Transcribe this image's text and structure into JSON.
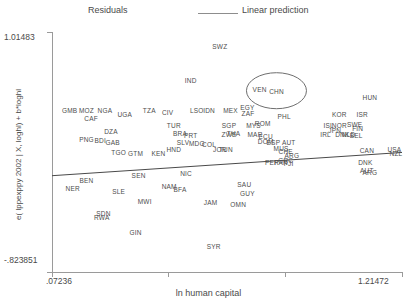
{
  "legend": {
    "residuals_label": "Residuals",
    "linear_prediction_label": "Linear prediction"
  },
  "axes": {
    "x_title": "ln human capital",
    "y_title": "e( lppexppy 2002 | X, loghl) + b*loghl",
    "x_min_label": ".07236",
    "x_max_label": "1.21472",
    "y_min_label": "-.823851",
    "y_max_label": "1.01483"
  },
  "chart_data": {
    "type": "scatter",
    "title": "",
    "xlabel": "ln human capital",
    "ylabel": "e( lppexppy 2002 | X, loghl) + b*loghl",
    "xlim": [
      0.07236,
      1.21472
    ],
    "ylim": [
      -0.823851,
      1.01483
    ],
    "grid": false,
    "legend_position": "top",
    "marker_style": "country-code-text-label",
    "annotations": [
      {
        "type": "ellipse",
        "label": "CHN",
        "x": 0.805,
        "y": 0.565,
        "rx_px": 30,
        "ry_px": 18
      }
    ],
    "series": [
      {
        "name": "Linear prediction",
        "type": "line",
        "x": [
          0.07236,
          1.21472
        ],
        "y": [
          -0.086,
          0.092
        ]
      },
      {
        "name": "Residuals",
        "type": "scatter",
        "points": [
          {
            "label": "SWZ",
            "x": 0.62,
            "y": 0.905
          },
          {
            "label": "IND",
            "x": 0.525,
            "y": 0.65
          },
          {
            "label": "VEN",
            "x": 0.75,
            "y": 0.58
          },
          {
            "label": "CHN",
            "x": 0.805,
            "y": 0.565
          },
          {
            "label": "HUN",
            "x": 1.11,
            "y": 0.52
          },
          {
            "label": "GMB",
            "x": 0.13,
            "y": 0.42
          },
          {
            "label": "MOZ",
            "x": 0.185,
            "y": 0.42
          },
          {
            "label": "NGA",
            "x": 0.245,
            "y": 0.42
          },
          {
            "label": "CAF",
            "x": 0.2,
            "y": 0.355
          },
          {
            "label": "UGA",
            "x": 0.31,
            "y": 0.39
          },
          {
            "label": "TZA",
            "x": 0.39,
            "y": 0.42
          },
          {
            "label": "CIV",
            "x": 0.45,
            "y": 0.405
          },
          {
            "label": "LSO",
            "x": 0.545,
            "y": 0.415
          },
          {
            "label": "IDN",
            "x": 0.585,
            "y": 0.415
          },
          {
            "label": "MEX",
            "x": 0.655,
            "y": 0.415
          },
          {
            "label": "EGY",
            "x": 0.71,
            "y": 0.44
          },
          {
            "label": "ZAF",
            "x": 0.712,
            "y": 0.398
          },
          {
            "label": "PHL",
            "x": 0.83,
            "y": 0.37
          },
          {
            "label": "KOR",
            "x": 1.01,
            "y": 0.39
          },
          {
            "label": "ISR",
            "x": 1.085,
            "y": 0.39
          },
          {
            "label": "DZA",
            "x": 0.265,
            "y": 0.255
          },
          {
            "label": "TUR",
            "x": 0.47,
            "y": 0.3
          },
          {
            "label": "SGP",
            "x": 0.65,
            "y": 0.3
          },
          {
            "label": "MYS",
            "x": 0.73,
            "y": 0.3
          },
          {
            "label": "ROM",
            "x": 0.76,
            "y": 0.315
          },
          {
            "label": "ISL",
            "x": 0.975,
            "y": 0.3
          },
          {
            "label": "NOR",
            "x": 1.01,
            "y": 0.3
          },
          {
            "label": "SWE",
            "x": 1.06,
            "y": 0.31
          },
          {
            "label": "FIN",
            "x": 1.07,
            "y": 0.28
          },
          {
            "label": "PNG",
            "x": 0.185,
            "y": 0.195
          },
          {
            "label": "BDI",
            "x": 0.23,
            "y": 0.185
          },
          {
            "label": "GAB",
            "x": 0.27,
            "y": 0.17
          },
          {
            "label": "BRA",
            "x": 0.49,
            "y": 0.24
          },
          {
            "label": "PRT",
            "x": 0.525,
            "y": 0.225
          },
          {
            "label": "THA",
            "x": 0.665,
            "y": 0.24
          },
          {
            "label": "ZWE",
            "x": 0.65,
            "y": 0.235
          },
          {
            "label": "MAR",
            "x": 0.735,
            "y": 0.235
          },
          {
            "label": "ECU",
            "x": 0.77,
            "y": 0.215
          },
          {
            "label": "JPN",
            "x": 0.995,
            "y": 0.265
          },
          {
            "label": "IRL",
            "x": 0.965,
            "y": 0.23
          },
          {
            "label": "DNK",
            "x": 1.02,
            "y": 0.23
          },
          {
            "label": "NLD",
            "x": 1.04,
            "y": 0.23
          },
          {
            "label": "BEL",
            "x": 1.065,
            "y": 0.225
          },
          {
            "label": "SLV",
            "x": 0.5,
            "y": 0.175
          },
          {
            "label": "MDG",
            "x": 0.545,
            "y": 0.165
          },
          {
            "label": "COL",
            "x": 0.585,
            "y": 0.155
          },
          {
            "label": "DOM",
            "x": 0.77,
            "y": 0.18
          },
          {
            "label": "ESP",
            "x": 0.795,
            "y": 0.175
          },
          {
            "label": "AUT",
            "x": 0.845,
            "y": 0.17
          },
          {
            "label": "HND",
            "x": 0.47,
            "y": 0.12
          },
          {
            "label": "JOR",
            "x": 0.62,
            "y": 0.12
          },
          {
            "label": "TUN",
            "x": 0.64,
            "y": 0.118
          },
          {
            "label": "MUS",
            "x": 0.82,
            "y": 0.13
          },
          {
            "label": "CHE",
            "x": 0.835,
            "y": 0.105
          },
          {
            "label": "CAN",
            "x": 1.1,
            "y": 0.115
          },
          {
            "label": "USA",
            "x": 1.19,
            "y": 0.12
          },
          {
            "label": "NZL",
            "x": 1.195,
            "y": 0.085
          },
          {
            "label": "TGO",
            "x": 0.29,
            "y": 0.095
          },
          {
            "label": "GTM",
            "x": 0.345,
            "y": 0.092
          },
          {
            "label": "KEN",
            "x": 0.42,
            "y": 0.085
          },
          {
            "label": "ARG",
            "x": 0.855,
            "y": 0.07
          },
          {
            "label": "GRC",
            "x": 0.835,
            "y": 0.035
          },
          {
            "label": "FJI",
            "x": 0.845,
            "y": 0.015
          },
          {
            "label": "PER",
            "x": 0.79,
            "y": 0.02
          },
          {
            "label": "PAN",
            "x": 0.82,
            "y": 0.018
          },
          {
            "label": "DNK2",
            "x": 1.095,
            "y": 0.02
          },
          {
            "label": "AUT2",
            "x": 1.1,
            "y": -0.045
          },
          {
            "label": "ARG2",
            "x": 1.11,
            "y": -0.055
          },
          {
            "label": "BEN",
            "x": 0.185,
            "y": -0.115
          },
          {
            "label": "SEN",
            "x": 0.355,
            "y": -0.08
          },
          {
            "label": "NIC",
            "x": 0.51,
            "y": -0.065
          },
          {
            "label": "SAU",
            "x": 0.7,
            "y": -0.15
          },
          {
            "label": "NER",
            "x": 0.14,
            "y": -0.18
          },
          {
            "label": "SLE",
            "x": 0.29,
            "y": -0.205
          },
          {
            "label": "NAM",
            "x": 0.455,
            "y": -0.165
          },
          {
            "label": "BFA",
            "x": 0.49,
            "y": -0.19
          },
          {
            "label": "GUY",
            "x": 0.71,
            "y": -0.215
          },
          {
            "label": "MWI",
            "x": 0.375,
            "y": -0.28
          },
          {
            "label": "JAM",
            "x": 0.59,
            "y": -0.29
          },
          {
            "label": "OMN",
            "x": 0.68,
            "y": -0.3
          },
          {
            "label": "SDN",
            "x": 0.24,
            "y": -0.37
          },
          {
            "label": "RWA",
            "x": 0.235,
            "y": -0.405
          },
          {
            "label": "GIN",
            "x": 0.345,
            "y": -0.52
          },
          {
            "label": "SYR",
            "x": 0.6,
            "y": -0.625
          }
        ]
      }
    ]
  },
  "colors": {
    "axis": "#9a9a9a",
    "text": "#4a4a4a",
    "point_text": "#4d4d4d",
    "fit_line": "#4a4a4a",
    "background": "#ffffff"
  }
}
